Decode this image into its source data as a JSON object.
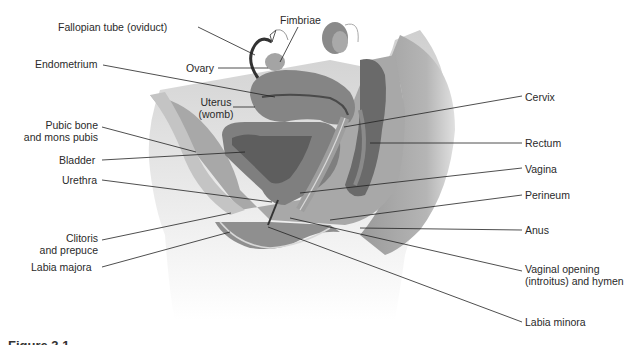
{
  "diagram": {
    "labels_left": [
      {
        "id": "fallopian-tube",
        "text": "Fallopian tube (oviduct)"
      },
      {
        "id": "ovary",
        "text": "Ovary"
      },
      {
        "id": "endometrium",
        "text": "Endometrium"
      },
      {
        "id": "uterus",
        "line1": "Uterus",
        "line2": "(womb)"
      },
      {
        "id": "pubic-bone",
        "line1": "Pubic bone",
        "line2": "and mons pubis"
      },
      {
        "id": "bladder",
        "text": "Bladder"
      },
      {
        "id": "urethra",
        "text": "Urethra"
      },
      {
        "id": "clitoris",
        "line1": "Clitoris",
        "line2": "and prepuce"
      },
      {
        "id": "labia-majora",
        "text": "Labia majora"
      }
    ],
    "labels_top": [
      {
        "id": "fimbriae",
        "text": "Fimbriae"
      }
    ],
    "labels_right": [
      {
        "id": "cervix",
        "text": "Cervix"
      },
      {
        "id": "rectum",
        "text": "Rectum"
      },
      {
        "id": "vagina",
        "text": "Vagina"
      },
      {
        "id": "perineum",
        "text": "Perineum"
      },
      {
        "id": "anus",
        "text": "Anus"
      },
      {
        "id": "vaginal-opening",
        "line1": "Vaginal opening",
        "line2": "(introitus) and hymen"
      },
      {
        "id": "labia-minora",
        "text": "Labia minora"
      }
    ],
    "caption": "Figure 3.1",
    "colors": {
      "tissue_mid": "#8c8c8c",
      "tissue_dark": "#5a5a5a",
      "tissue_light": "#b8b8b8",
      "body_light": "#d4d4d4",
      "leader_line": "#222222",
      "text": "#2a2a2a"
    }
  }
}
